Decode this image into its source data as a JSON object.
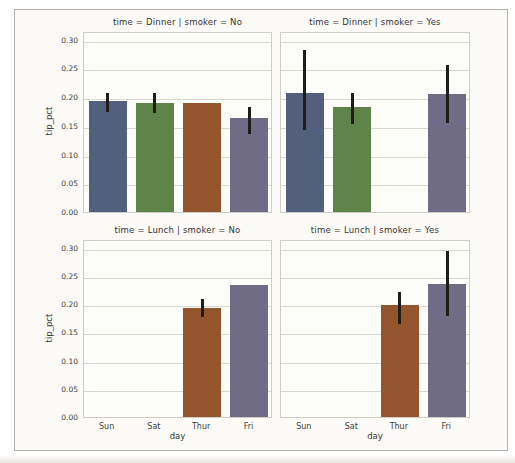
{
  "chart_data": {
    "type": "bar",
    "facet_rows": "time",
    "facet_cols": "smoker",
    "categories": [
      "Sun",
      "Sat",
      "Thur",
      "Fri"
    ],
    "xlabel": "day",
    "ylabel": "tip_pct",
    "ylim": [
      0,
      0.315
    ],
    "yticks": [
      0.0,
      0.05,
      0.1,
      0.15,
      0.2,
      0.25,
      0.3
    ],
    "grid": "horizontal",
    "legend": "none",
    "palette": [
      "#525f7d",
      "#5e8449",
      "#94552e",
      "#706c86"
    ],
    "style": {
      "errorbar_color": "#1f1d1a",
      "gridline_color": "#d8d6cf",
      "spine_color": "#cfcdc6",
      "frame_color": "#b3b1ad",
      "page_bg": "#fcfbf7",
      "panel_bg": "#fdfdfa",
      "text_color": "#3b3b3b"
    },
    "panels": [
      {
        "title": "time = Dinner | smoker = No",
        "values": [
          0.193,
          0.19,
          0.19,
          0.164
        ],
        "ci": [
          [
            0.178,
            0.21
          ],
          [
            0.175,
            0.21
          ],
          null,
          [
            0.139,
            0.187
          ]
        ]
      },
      {
        "title": "time = Dinner | smoker = Yes",
        "values": [
          0.207,
          0.183,
          null,
          0.205
        ],
        "ci": [
          [
            0.146,
            0.285
          ],
          [
            0.156,
            0.21
          ],
          null,
          [
            0.158,
            0.26
          ]
        ]
      },
      {
        "title": "time = Lunch | smoker = No",
        "values": [
          null,
          null,
          0.193,
          0.233
        ],
        "ci": [
          null,
          null,
          [
            0.18,
            0.213
          ],
          null
        ]
      },
      {
        "title": "time = Lunch | smoker = Yes",
        "values": [
          null,
          null,
          0.199,
          0.236
        ],
        "ci": [
          null,
          null,
          [
            0.168,
            0.225
          ],
          [
            0.182,
            0.298
          ]
        ]
      }
    ]
  }
}
